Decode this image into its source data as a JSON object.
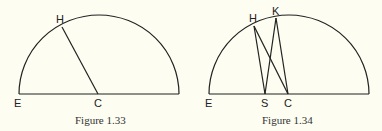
{
  "figures": [
    {
      "caption": "Figure 1.33",
      "labels": {
        "E": "E",
        "C": "C",
        "H": "H"
      }
    },
    {
      "caption": "Figure 1.34",
      "labels": {
        "E": "E",
        "S": "S",
        "C": "C",
        "H": "H",
        "K": "K"
      }
    }
  ],
  "colors": {
    "background": "#fdfdf2",
    "stroke": "#222222"
  }
}
